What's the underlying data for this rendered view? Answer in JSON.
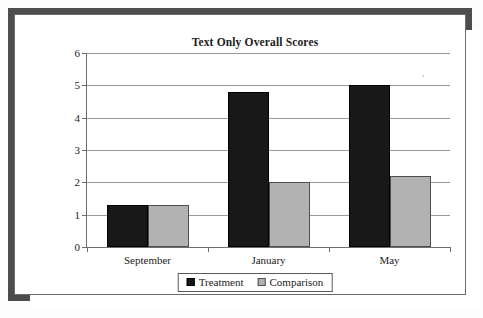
{
  "frame": {
    "border_color": "#4d4d4d",
    "background": "#ffffff"
  },
  "chart_data": {
    "type": "bar",
    "title": "Text Only Overall Scores",
    "xlabel": "",
    "ylabel": "",
    "categories": [
      "September",
      "January",
      "May"
    ],
    "series": [
      {
        "name": "Treatment",
        "color": "#181818",
        "values": [
          1.3,
          4.8,
          5.0
        ]
      },
      {
        "name": "Comparison",
        "color": "#b2b2b2",
        "values": [
          1.3,
          2.0,
          2.2
        ]
      }
    ],
    "ylim": [
      0,
      6
    ],
    "yticks": [
      0,
      1,
      2,
      3,
      4,
      5,
      6
    ],
    "ytick_labels": [
      "0",
      "1",
      "2",
      "3",
      "4",
      "5",
      "6"
    ],
    "grid": true,
    "grid_axis": "y",
    "legend_position": "bottom",
    "legend": [
      "Treatment",
      "Comparison"
    ]
  }
}
